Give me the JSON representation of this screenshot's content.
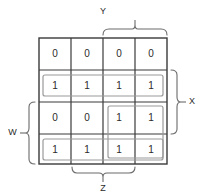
{
  "diagram": {
    "kind": "karnaugh-map",
    "rows": 4,
    "cols": 4,
    "cells": [
      [
        "0",
        "0",
        "0",
        "0"
      ],
      [
        "1",
        "1",
        "1",
        "1"
      ],
      [
        "0",
        "0",
        "1",
        "1"
      ],
      [
        "1",
        "1",
        "1",
        "1"
      ]
    ],
    "variables": {
      "top": "Y",
      "right": "X",
      "left": "W",
      "bottom": "Z"
    },
    "groups": [
      {
        "name": "row2-full-group",
        "row_start": 2,
        "row_end": 2,
        "col_start": 1,
        "col_end": 4
      },
      {
        "name": "rows34-cols34-group",
        "row_start": 3,
        "row_end": 4,
        "col_start": 3,
        "col_end": 4
      },
      {
        "name": "row4-full-group",
        "row_start": 4,
        "row_end": 4,
        "col_start": 1,
        "col_end": 4
      }
    ],
    "colors": {
      "grid_line": "#3a3a3a",
      "group_line": "#9a9a9a",
      "brace_line": "#6b6b6b",
      "text": "#2b2b2b",
      "background": "#ffffff"
    }
  }
}
